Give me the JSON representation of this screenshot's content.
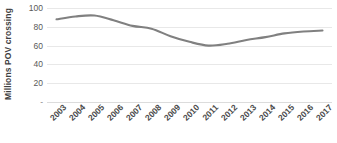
{
  "chart_data": {
    "type": "line",
    "title": "",
    "xlabel": "",
    "ylabel": "Millions POV crossing",
    "categories": [
      "2003",
      "2004",
      "2005",
      "2006",
      "2007",
      "2008",
      "2009",
      "2010",
      "2011",
      "2012",
      "2013",
      "2014",
      "2015",
      "2016",
      "2017"
    ],
    "values": [
      88,
      91,
      92,
      87,
      81,
      78,
      70,
      64,
      60,
      62,
      66,
      69,
      73,
      75,
      76
    ],
    "series": [
      {
        "name": "Millions POV crossing",
        "values": [
          88,
          91,
          92,
          87,
          81,
          78,
          70,
          64,
          60,
          62,
          66,
          69,
          73,
          75,
          76
        ]
      }
    ],
    "ylim": [
      0,
      100
    ],
    "y_ticks": [
      "100",
      "80",
      "60",
      "40",
      "20",
      "-"
    ],
    "y_tick_values": [
      100,
      80,
      60,
      40,
      20,
      0
    ],
    "grid": true,
    "legend": "none",
    "line_color": "#808080",
    "gridline_color": "#e8e8e8",
    "smooth": true
  }
}
